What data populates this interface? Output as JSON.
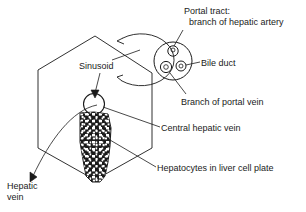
{
  "diagram": {
    "type": "biological-schematic",
    "background_color": "#ffffff",
    "line_color": "#1a1a1a",
    "labels": {
      "portal_tract_line1": "Portal tract:",
      "portal_tract_line2": "branch of hepatic artery",
      "bile_duct": "Bile duct",
      "branch_of_portal_vein": "Branch of portal vein",
      "sinusoid": "Sinusoid",
      "central_hepatic_vein": "Central hepatic vein",
      "hepatocytes": "Hepatocytes in liver cell plate",
      "hepatic_vein_line1": "Hepatic",
      "hepatic_vein_line2": "vein"
    },
    "structures": {
      "lobule_hexagon": "hexagonal liver lobule outline",
      "magnifier_circle": "magnified portal tract callout circle",
      "portal_triad_circle": "portal tract containing three vessels",
      "vessel_hepatic_artery": "branch of hepatic artery",
      "vessel_portal_vein": "branch of portal vein",
      "vessel_bile_duct": "bile duct",
      "central_vein_circle": "central hepatic vein opening",
      "hepatocyte_plate": "stippled column of hepatocytes",
      "curved_arrow": "magnification indicator arrow"
    }
  }
}
